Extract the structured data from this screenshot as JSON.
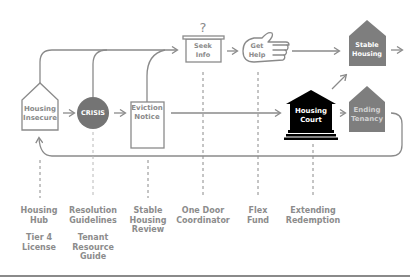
{
  "diagram": {
    "colors": {
      "line": "#8a8a8a",
      "crisis_fill": "#747474",
      "court_fill": "#000000",
      "outcome_fill": "#7e7e7e",
      "outline_text": "#8a8a8a",
      "filled_text": "#ffffff",
      "label_text": "#8c8c8c"
    },
    "nodes": {
      "housing_insecure": {
        "line1": "Housing",
        "line2": "Insecure",
        "shape": "house-outline"
      },
      "crisis": {
        "label": "CRISIS",
        "shape": "circle-filled"
      },
      "eviction_notice": {
        "line1": "Eviction",
        "line2": "Notice",
        "shape": "document-outline"
      },
      "seek_info": {
        "line1": "Seek",
        "line2": "Info",
        "question_mark": "?",
        "shape": "box-with-lid"
      },
      "get_help": {
        "line1": "Get",
        "line2": "Help",
        "shape": "hand-outline"
      },
      "stable_housing": {
        "line1": "Stable",
        "line2": "Housing",
        "shape": "house-filled"
      },
      "housing_court": {
        "line1": "Housing",
        "line2": "Court",
        "shape": "courthouse-filled"
      },
      "ending_tenancy": {
        "line1": "Ending",
        "line2": "Tenancy",
        "shape": "house-filled"
      }
    },
    "interventions": [
      {
        "lines": [
          "Housing",
          "Hub",
          "",
          "Tier 4",
          "License"
        ]
      },
      {
        "lines": [
          "Resolution",
          "Guidelines",
          "",
          "Tenant",
          "Resource",
          "Guide"
        ]
      },
      {
        "lines": [
          "Stable",
          "Housing",
          "Review"
        ]
      },
      {
        "lines": [
          "One Door",
          "Coordinator"
        ]
      },
      {
        "lines": [
          "Flex",
          "Fund"
        ]
      },
      {
        "lines": [
          "Extending",
          "Redemption"
        ]
      }
    ]
  }
}
